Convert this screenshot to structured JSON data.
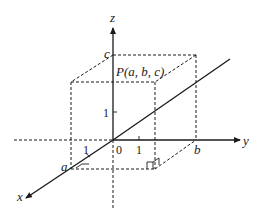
{
  "diagram": {
    "axes": {
      "x_label": "x",
      "y_label": "y",
      "z_label": "z",
      "origin_label": "0"
    },
    "ticks": {
      "x_one": "1",
      "y_one": "1",
      "z_one": "1"
    },
    "coordinates": {
      "a": "a",
      "b": "b",
      "c": "c"
    },
    "point_label": "P(a, b, c)",
    "colors": {
      "stroke": "#1a1a1a",
      "background": "#ffffff"
    }
  }
}
